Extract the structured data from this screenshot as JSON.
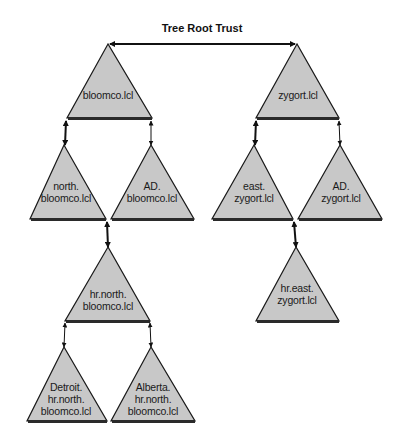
{
  "title": "Tree Root Trust",
  "colors": {
    "triangle_fill": "#c8c8c8",
    "triangle_stroke": "#1a1a1a",
    "base_bar": "#2a2a2a",
    "arrow": "#111111",
    "background": "#ffffff"
  },
  "trees": [
    {
      "name": "bloomco.lcl",
      "domains": [
        {
          "id": "bloomco",
          "lines": [
            "bloomco.lcl"
          ]
        },
        {
          "id": "north-bloomco",
          "lines": [
            "north.",
            "bloomco.lcl"
          ]
        },
        {
          "id": "ad-bloomco",
          "lines": [
            "AD.",
            "bloomco.lcl"
          ]
        },
        {
          "id": "hr-north-bloomco",
          "lines": [
            "hr.north.",
            "bloomco.lcl"
          ]
        },
        {
          "id": "detroit-hr-north-bloomco",
          "lines": [
            "Detroit.",
            "hr.north.",
            "bloomco.lcl"
          ]
        },
        {
          "id": "alberta-hr-north-bloomco",
          "lines": [
            "Alberta.",
            "hr.north.",
            "bloomco.lcl"
          ]
        }
      ]
    },
    {
      "name": "zygort.lcl",
      "domains": [
        {
          "id": "zygort",
          "lines": [
            "zygort.lcl"
          ]
        },
        {
          "id": "east-zygort",
          "lines": [
            "east.",
            "zygort.lcl"
          ]
        },
        {
          "id": "ad-zygort",
          "lines": [
            "AD.",
            "zygort.lcl"
          ]
        },
        {
          "id": "hr-east-zygort",
          "lines": [
            "hr.east.",
            "zygort.lcl"
          ]
        }
      ]
    }
  ],
  "trusts": [
    {
      "from": "bloomco.lcl",
      "to": "zygort.lcl",
      "type": "tree-root",
      "style": "bold"
    },
    {
      "from": "bloomco.lcl",
      "to": "north.bloomco.lcl",
      "style": "bold"
    },
    {
      "from": "bloomco.lcl",
      "to": "AD.bloomco.lcl",
      "style": "thin"
    },
    {
      "from": "north.bloomco.lcl",
      "to": "hr.north.bloomco.lcl",
      "style": "bold"
    },
    {
      "from": "hr.north.bloomco.lcl",
      "to": "Detroit.hr.north.bloomco.lcl",
      "style": "thin"
    },
    {
      "from": "hr.north.bloomco.lcl",
      "to": "Alberta.hr.north.bloomco.lcl",
      "style": "thin"
    },
    {
      "from": "zygort.lcl",
      "to": "east.zygort.lcl",
      "style": "bold"
    },
    {
      "from": "zygort.lcl",
      "to": "AD.zygort.lcl",
      "style": "thin"
    },
    {
      "from": "east.zygort.lcl",
      "to": "hr.east.zygort.lcl",
      "style": "bold"
    }
  ]
}
